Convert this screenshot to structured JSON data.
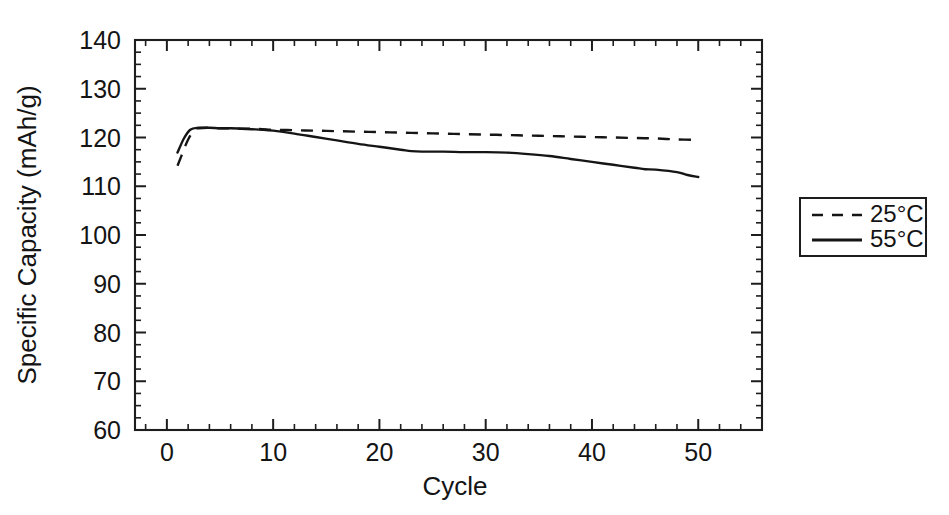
{
  "chart_data": {
    "type": "line",
    "title": "",
    "xlabel": "Cycle",
    "ylabel": "Specific Capacity (mAh/g)",
    "xlim": [
      -3,
      56
    ],
    "ylim": [
      60,
      140
    ],
    "xticks": [
      0,
      10,
      20,
      30,
      40,
      50
    ],
    "yticks": [
      60,
      70,
      80,
      90,
      100,
      110,
      120,
      130,
      140
    ],
    "xtick_labels": [
      "0",
      "10",
      "20",
      "30",
      "40",
      "50"
    ],
    "ytick_labels": [
      "60",
      "70",
      "80",
      "90",
      "100",
      "110",
      "120",
      "130",
      "140"
    ],
    "x_minor_step": 2,
    "y_minor_step": 2.5,
    "grid": false,
    "frame": "box",
    "tick_direction": "in",
    "legend_position": "outside-right",
    "legend": [
      {
        "label": "25°C",
        "style": "dashed"
      },
      {
        "label": "55°C",
        "style": "solid"
      }
    ],
    "series": [
      {
        "name": "25°C",
        "style": "dashed",
        "x": [
          1,
          1.4,
          2,
          2.6,
          3,
          4,
          5,
          6,
          7,
          8,
          9,
          10,
          12,
          14,
          16,
          18,
          20,
          22,
          24,
          26,
          28,
          30,
          32,
          34,
          36,
          38,
          40,
          42,
          44,
          46,
          48,
          50
        ],
        "y": [
          114.2,
          116.4,
          119.6,
          121.6,
          121.9,
          122.0,
          121.9,
          121.9,
          121.8,
          121.8,
          121.7,
          121.6,
          121.5,
          121.4,
          121.3,
          121.2,
          121.1,
          121.0,
          120.9,
          120.8,
          120.7,
          120.6,
          120.5,
          120.4,
          120.3,
          120.2,
          120.1,
          120.0,
          119.9,
          119.8,
          119.6,
          119.5
        ]
      },
      {
        "name": "55°C",
        "style": "solid",
        "x": [
          1,
          1.6,
          2.2,
          3,
          4,
          5,
          6,
          7,
          8,
          9,
          10,
          12,
          14,
          16,
          18,
          20,
          22,
          23,
          24,
          26,
          28,
          30,
          32,
          34,
          36,
          38,
          40,
          42,
          44,
          45,
          46,
          48,
          49,
          50
        ],
        "y": [
          116.9,
          119.8,
          121.6,
          122.0,
          122.0,
          121.9,
          121.9,
          121.8,
          121.7,
          121.6,
          121.4,
          120.8,
          120.1,
          119.4,
          118.7,
          118.1,
          117.5,
          117.2,
          117.1,
          117.1,
          117.0,
          117.0,
          116.9,
          116.6,
          116.2,
          115.6,
          115.0,
          114.4,
          113.8,
          113.5,
          113.4,
          112.9,
          112.3,
          111.9
        ]
      }
    ]
  },
  "axis_titles": {
    "x": "Cycle",
    "y": "Specific Capacity (mAh/g)"
  }
}
